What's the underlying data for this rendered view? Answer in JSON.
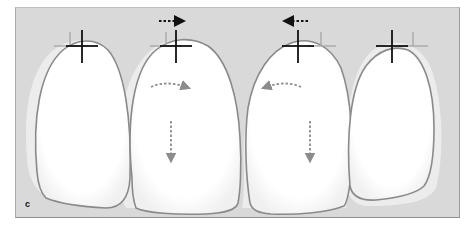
{
  "figure": {
    "panel_label": "c",
    "background_color": "#d9d9d9",
    "tooth_outline_color": "#8a8a8a",
    "marker_color": "#111111",
    "ghost_marker_color": "#a8a8a8",
    "arrow_dark_color": "#111111",
    "arrow_light_color": "#8c8c8c",
    "teeth": [
      {
        "id": "tooth-1",
        "marker": "crosshair",
        "movement": "none"
      },
      {
        "id": "tooth-2",
        "marker": "crosshair",
        "movement": "shift-right-and-down"
      },
      {
        "id": "tooth-3",
        "marker": "crosshair",
        "movement": "shift-left-and-down"
      },
      {
        "id": "tooth-4",
        "marker": "crosshair",
        "movement": "none"
      }
    ],
    "arrows": [
      {
        "location": "above tooth-2",
        "direction": "right",
        "style": "dotted",
        "color": "dark"
      },
      {
        "location": "above tooth-3",
        "direction": "left",
        "style": "dotted",
        "color": "dark"
      },
      {
        "location": "tooth-2 upper",
        "direction": "curved-right",
        "style": "dotted",
        "color": "light"
      },
      {
        "location": "tooth-3 upper",
        "direction": "curved-left",
        "style": "dotted",
        "color": "light"
      },
      {
        "location": "tooth-2 middle",
        "direction": "down",
        "style": "dotted",
        "color": "light"
      },
      {
        "location": "tooth-3 middle",
        "direction": "down",
        "style": "dotted",
        "color": "light"
      }
    ]
  }
}
